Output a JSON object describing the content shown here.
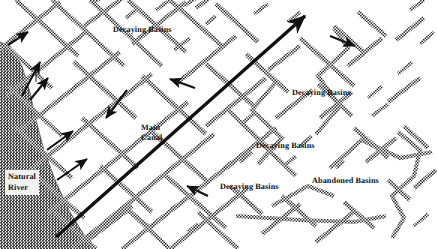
{
  "figure": {
    "name": "irrigation-canal-network-map",
    "width": 437,
    "height": 249,
    "background_color": "#ffffff",
    "ink_color": "#3a3a3a",
    "river_fill_color": "#8c8c8c",
    "arrow_color": "#111111"
  },
  "labels": [
    {
      "id": "decaying-basins-top",
      "text": "Decaying Basins",
      "x": 113,
      "y": 25,
      "boxed": false
    },
    {
      "id": "decaying-basins-right",
      "text": "Decaying Basins",
      "x": 292,
      "y": 88,
      "boxed": false
    },
    {
      "id": "decaying-basins-mid",
      "text": "Decaying Basins",
      "x": 256,
      "y": 141,
      "boxed": false
    },
    {
      "id": "decaying-basins-lower",
      "text": "Decaying Basins",
      "x": 220,
      "y": 182,
      "boxed": false
    },
    {
      "id": "abandoned-basins",
      "text": "Abandoned Basins",
      "x": 312,
      "y": 176,
      "boxed": false
    },
    {
      "id": "main-canal",
      "text": "Main\nCanal",
      "x": 141,
      "y": 123,
      "boxed": false
    },
    {
      "id": "natural-river",
      "text": "Natural\nRiver",
      "x": 5,
      "y": 170,
      "boxed": true
    }
  ],
  "features": {
    "river": {
      "name": "natural-river-polygon",
      "description": "wedge-shaped dark-gray stippled river floodplain along the left edge widening toward the bottom"
    },
    "main_canal_arrow": {
      "name": "main-canal-arrow",
      "description": "long thick black arrow running from lower-left to upper-right across the figure",
      "from": [
        56,
        237
      ],
      "to": [
        305,
        14
      ]
    },
    "offtake_arrows": [
      {
        "name": "offtake-arrow-1",
        "from": [
          8,
          45
        ],
        "to": [
          28,
          32
        ]
      },
      {
        "name": "offtake-arrow-2",
        "from": [
          22,
          96
        ],
        "to": [
          40,
          62
        ]
      },
      {
        "name": "offtake-arrow-3",
        "from": [
          30,
          100
        ],
        "to": [
          48,
          78
        ]
      },
      {
        "name": "offtake-arrow-4",
        "from": [
          47,
          150
        ],
        "to": [
          73,
          131
        ]
      },
      {
        "name": "offtake-arrow-5",
        "from": [
          57,
          180
        ],
        "to": [
          87,
          159
        ]
      },
      {
        "name": "offtake-arrow-6",
        "from": [
          127,
          90
        ],
        "to": [
          106,
          118
        ]
      },
      {
        "name": "offtake-arrow-7",
        "from": [
          195,
          88
        ],
        "to": [
          170,
          79
        ]
      },
      {
        "name": "offtake-arrow-8",
        "from": [
          208,
          196
        ],
        "to": [
          187,
          186
        ]
      },
      {
        "name": "offtake-arrow-9",
        "from": [
          330,
          36
        ],
        "to": [
          355,
          46
        ]
      }
    ],
    "canal_network": {
      "name": "canal-network",
      "description": "dense grid of hatched/stippled diagonal canal lines forming lozenge-shaped basins; dense at left, sparse and broken at right where basins are abandoned"
    }
  }
}
